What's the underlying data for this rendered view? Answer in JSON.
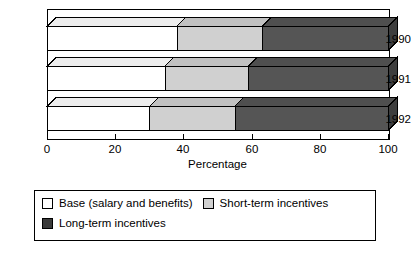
{
  "chart_data": {
    "type": "bar",
    "orientation": "horizontal",
    "stacked": true,
    "style": "3d",
    "title": "",
    "subtitle": "",
    "xlabel": "Percentage",
    "ylabel": "",
    "xlim": [
      0,
      100
    ],
    "xticks": [
      0,
      20,
      40,
      60,
      80,
      100
    ],
    "xtick_labels": [
      "0",
      "20",
      "40",
      "60",
      "80",
      "100"
    ],
    "categories": [
      "1990",
      "1991",
      "1992"
    ],
    "grid": false,
    "legend_position": "bottom",
    "series": [
      {
        "name": "Base (salary and benefits)",
        "color": "#ffffff",
        "values": [
          38,
          34.5,
          30
        ]
      },
      {
        "name": "Short-term incentives",
        "color": "#d0d0d0",
        "values": [
          25,
          24.5,
          25
        ]
      },
      {
        "name": "Long-term incentives",
        "color": "#555555",
        "values": [
          37,
          41,
          45
        ]
      }
    ]
  },
  "axis": {
    "x_title": "Percentage",
    "tick_labels": [
      "0",
      "20",
      "40",
      "60",
      "80",
      "100"
    ],
    "category_labels": [
      "1990",
      "1991",
      "1992"
    ]
  },
  "legend": {
    "items": [
      {
        "label": "Base (salary and benefits)",
        "color": "#ffffff"
      },
      {
        "label": "Short-term incentives",
        "color": "#d0d0d0"
      },
      {
        "label": "Long-term incentives",
        "color": "#3a3a3a"
      }
    ]
  },
  "colors": {
    "base": "#ffffff",
    "short_term": "#d0d0d0",
    "long_term": "#555555",
    "long_term_legend": "#3a3a3a",
    "outline": "#000000",
    "background": "#ffffff"
  }
}
